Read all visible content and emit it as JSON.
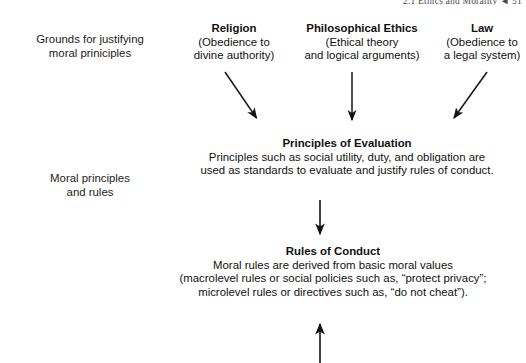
{
  "page": {
    "running_head": "2.1 Ethics and Morality   ◄  51",
    "background_color": "#ffffff",
    "ink_color": "#111111"
  },
  "row_labels": [
    {
      "key": "grounds",
      "name": "row-label-grounds",
      "text": "Grounds for justifying\nmoral priniciples"
    },
    {
      "key": "moral",
      "name": "row-label-moral-principles",
      "text": "Moral principles\nand rules"
    }
  ],
  "columns": [
    {
      "key": "religion",
      "title": "Religion",
      "subtitle": "(Obedience to\ndivine authority)"
    },
    {
      "key": "philosophy",
      "title": "Philosophical Ethics",
      "subtitle": "(Ethical theory\nand logical arguments)"
    },
    {
      "key": "law",
      "title": "Law",
      "subtitle": "(Obedience to\na legal system)"
    }
  ],
  "nodes": [
    {
      "key": "principles_of_evaluation",
      "title": "Principles of Evaluation",
      "body": "Principles such as social utility, duty, and obligation are\nused as standards to evaluate and justify rules of conduct."
    },
    {
      "key": "rules_of_conduct",
      "title": "Rules of Conduct",
      "body": "Moral rules are derived from basic moral values\n(macrolevel rules or social policies such as, “protect privacy”;\nmicrolevel rules or directives such as, “do not cheat”)."
    }
  ],
  "arrows": [
    {
      "key": "religion-to-principles",
      "name": "arrow-religion-to-principles",
      "direction": "down-right",
      "from": [
        225,
        72
      ],
      "to": [
        258,
        120
      ]
    },
    {
      "key": "philosophy-to-principles",
      "name": "arrow-philosophy-to-principles",
      "direction": "down",
      "from": [
        352,
        72
      ],
      "to": [
        352,
        122
      ]
    },
    {
      "key": "law-to-principles",
      "name": "arrow-law-to-principles",
      "direction": "down-left",
      "from": [
        487,
        72
      ],
      "to": [
        452,
        120
      ]
    },
    {
      "key": "principles-to-rules",
      "name": "arrow-principles-to-rules",
      "direction": "down",
      "from": [
        320,
        200
      ],
      "to": [
        320,
        236
      ]
    },
    {
      "key": "below-to-rules",
      "name": "arrow-upward-into-rules",
      "direction": "up",
      "from": [
        320,
        363
      ],
      "to": [
        320,
        322
      ]
    }
  ]
}
